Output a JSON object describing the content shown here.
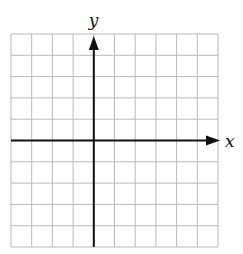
{
  "diagram": {
    "type": "coordinate-grid",
    "grid": {
      "columns": 10,
      "rows": 10,
      "left": 11,
      "top": 34,
      "right": 218,
      "bottom": 247,
      "line_color": "#b9b9b9"
    },
    "axes": {
      "x_label": "x",
      "y_label": "y",
      "y_axis_column_index": 4,
      "x_axis_row_index": 5,
      "color": "#111111",
      "x_arrow": "right",
      "y_arrow": "up"
    }
  }
}
